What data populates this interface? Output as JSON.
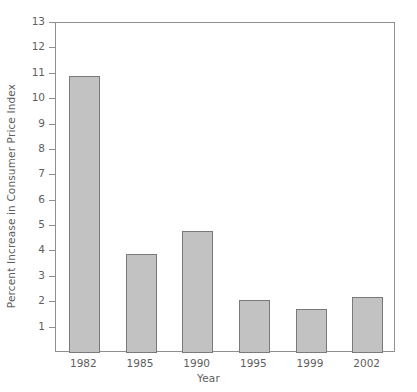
{
  "chart_data": {
    "type": "bar",
    "title": "",
    "subtitle": "",
    "xlabel": "Year",
    "ylabel": "Percent Increase in Consumer Price Index",
    "categories": [
      "1982",
      "1985",
      "1990",
      "1995",
      "1999",
      "2002"
    ],
    "values": [
      10.9,
      3.9,
      4.8,
      2.1,
      1.75,
      2.2
    ],
    "ylim": [
      0,
      13
    ],
    "y_ticks": [
      1,
      2,
      3,
      4,
      5,
      6,
      7,
      8,
      9,
      10,
      11,
      12,
      13
    ],
    "y_tick_labels": [
      "1",
      "2",
      "3",
      "4",
      "5",
      "6",
      "7",
      "8",
      "9",
      "10",
      "11",
      "12",
      "13"
    ],
    "grid": false,
    "legend": null,
    "annotations": [],
    "bar_color": "#c2c2c2",
    "bar_edge_color": "#7a7a7a",
    "axis_color": "#8f8f8f",
    "text_color": "#5e5e5e",
    "background_color": "#ffffff"
  }
}
